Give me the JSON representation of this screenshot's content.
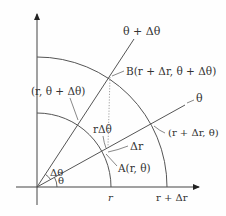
{
  "diagram": {
    "type": "polar-coordinate-element",
    "labels": {
      "theta_plus_dtheta_ray": "θ + Δθ",
      "theta_ray": "θ",
      "point_B": "B(r + Δr, θ + Δθ)",
      "point_r_theta_dtheta": "(r, θ + Δθ)",
      "arc_length": "rΔθ",
      "point_r_dr_theta": "(r + Δr, θ)",
      "radial_increment": "Δr",
      "point_A": "A(r, θ)",
      "angle_dtheta": "Δθ",
      "angle_theta": "θ",
      "x_tick_r": "r",
      "x_tick_r_dr": "r + Δr"
    },
    "colors": {
      "line": "#444444",
      "text": "#333333",
      "background": "#fefefe"
    }
  }
}
